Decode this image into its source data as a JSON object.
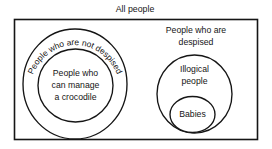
{
  "diagram": {
    "type": "euler-diagram",
    "title": "All people",
    "background_color": "#ffffff",
    "stroke_color": "#151515",
    "universe": {
      "name": "All people",
      "shape": "rectangle",
      "label": "All people",
      "label_position": "above-top-center"
    },
    "sets": {
      "not_despised": {
        "label": "People who are not despised",
        "shape": "circle",
        "label_style": "curved-along-arc",
        "contains": "can_manage_crocodile"
      },
      "can_manage_crocodile": {
        "label_lines": [
          "People who",
          "can manage",
          "a crocodile"
        ],
        "line1": "People who",
        "line2": "can manage",
        "line3": "a crocodile",
        "shape": "circle"
      },
      "despised": {
        "label_lines": [
          "People who are",
          "despised"
        ],
        "line1": "People who are",
        "line2": "despised",
        "shape": "circle",
        "label_style": "straight-above",
        "contains": "illogical_people"
      },
      "illogical_people": {
        "label_lines": [
          "Illogical",
          "people"
        ],
        "line1": "Illogical",
        "line2": "people",
        "shape": "circle",
        "contains": "babies"
      },
      "babies": {
        "label": "Babies",
        "shape": "circle"
      }
    }
  }
}
